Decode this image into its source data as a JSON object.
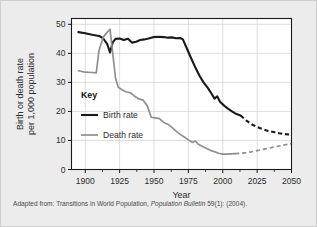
{
  "figure": {
    "background_color": "#ececec",
    "plot_background_color": "#ffffff",
    "caption_prefix": "Adapted from: Transitions in World Population,",
    "caption_source_italic": "Population Bulletin",
    "caption_suffix": "59(1): (2004)."
  },
  "chart_data": {
    "type": "line",
    "title": "",
    "xlabel": "Year",
    "ylabel_line1": "Birth or death rate",
    "ylabel_line2": "per 1,000 population",
    "xlim": [
      1890,
      2050
    ],
    "ylim": [
      0,
      52
    ],
    "xticks": [
      1900,
      1925,
      1950,
      1975,
      2000,
      2025,
      2050
    ],
    "xtick_labels": [
      "1900",
      "1925",
      "1950",
      "1975",
      "2000",
      "2025",
      "2050"
    ],
    "xminor_ticks": [
      1912.5,
      1937.5,
      1962.5,
      1987.5,
      2012.5,
      2037.5
    ],
    "yticks": [
      0,
      10,
      20,
      30,
      40,
      50
    ],
    "ytick_labels": [
      "0",
      "10",
      "20",
      "30",
      "40",
      "50"
    ],
    "grid": true,
    "grid_color": "#cfcfcf",
    "legend_position": "inside-left",
    "legend_title": "Key",
    "series": [
      {
        "name": "Birth rate",
        "color": "#1a1a1a",
        "width": 2.1,
        "x": [
          1895,
          1900,
          1905,
          1910,
          1913,
          1916,
          1918,
          1920,
          1922,
          1925,
          1928,
          1931,
          1934,
          1937,
          1940,
          1943,
          1946,
          1950,
          1953,
          1957,
          1960,
          1963,
          1966,
          1969,
          1971,
          1974,
          1977,
          1980,
          1983,
          1986,
          1989,
          1992,
          1994,
          1996,
          1998,
          2001,
          2004,
          2007,
          2010,
          2013
        ],
        "y": [
          47.3,
          46.9,
          46.4,
          46.0,
          45.2,
          43.2,
          40.3,
          43.8,
          45.0,
          45.1,
          44.6,
          45.0,
          43.7,
          44.0,
          44.6,
          44.8,
          45.1,
          45.6,
          45.7,
          45.6,
          45.4,
          45.5,
          45.2,
          45.3,
          44.8,
          41.6,
          38.3,
          35.2,
          32.4,
          30.0,
          28.2,
          26.0,
          24.4,
          25.2,
          23.3,
          22.0,
          20.9,
          19.9,
          19.1,
          18.6
        ],
        "projection_x": [
          2013,
          2017,
          2021,
          2025,
          2029,
          2033,
          2037,
          2041,
          2045,
          2050
        ],
        "projection_y": [
          18.6,
          16.9,
          15.6,
          14.6,
          13.9,
          13.3,
          12.9,
          12.5,
          12.2,
          12.0
        ],
        "projection_style": "dashed"
      },
      {
        "name": "Death rate",
        "color": "#8f8f8f",
        "width": 1.7,
        "x": [
          1895,
          1900,
          1905,
          1908,
          1910,
          1913,
          1916,
          1918,
          1920,
          1922,
          1924,
          1927,
          1930,
          1933,
          1936,
          1939,
          1942,
          1945,
          1948,
          1951,
          1954,
          1957,
          1960,
          1963,
          1966,
          1969,
          1972,
          1975,
          1978,
          1980,
          1982,
          1985,
          1988,
          1991,
          1994,
          1997,
          2000,
          2003,
          2006,
          2009
        ],
        "y": [
          34.0,
          33.5,
          33.4,
          33.3,
          41.0,
          45.5,
          47.3,
          48.3,
          40.0,
          31.5,
          28.3,
          27.4,
          26.7,
          26.4,
          25.2,
          24.3,
          23.9,
          22.0,
          18.0,
          17.8,
          17.5,
          16.2,
          15.6,
          14.5,
          13.2,
          12.1,
          11.2,
          10.2,
          9.3,
          9.8,
          8.8,
          8.0,
          7.3,
          6.6,
          6.1,
          5.6,
          5.3,
          5.3,
          5.4,
          5.5
        ],
        "projection_x": [
          2009,
          2013,
          2017,
          2021,
          2025,
          2029,
          2033,
          2037,
          2041,
          2045,
          2050
        ],
        "projection_y": [
          5.5,
          5.6,
          5.8,
          6.1,
          6.5,
          6.9,
          7.3,
          7.7,
          8.1,
          8.5,
          8.9
        ],
        "projection_style": "dashed"
      }
    ]
  }
}
